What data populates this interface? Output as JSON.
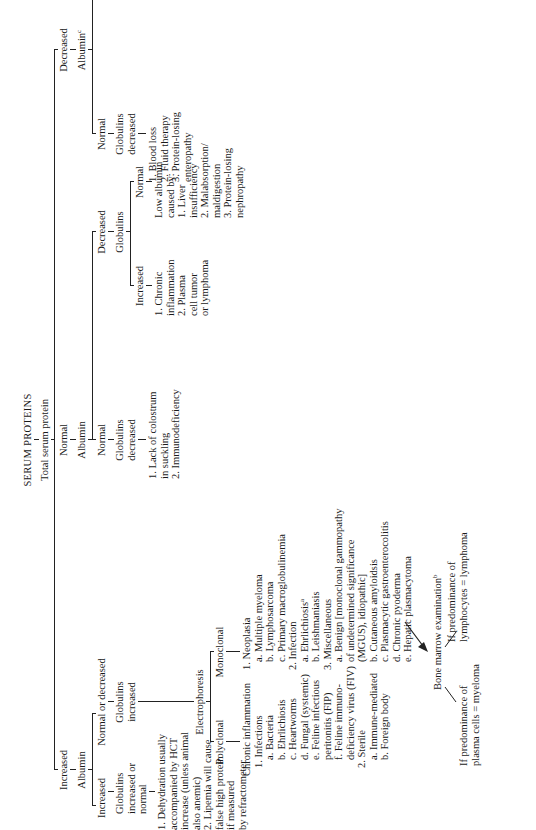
{
  "title": "SERUM PROTEINS",
  "root": "Total serum protein",
  "level1": {
    "increased": "Increased",
    "normal": "Normal",
    "decreased": "Decreased"
  },
  "branch_increased": {
    "albumin": "Albumin",
    "alb_increased": "Increased",
    "alb_normal_or_decreased": "Normal  or  decreased",
    "glob_inc_or_normal": "Globulins\nincreased or\nnormal",
    "glob_increased": "Globulins\nincreased",
    "causes": "1. Dehydration usually\naccompanied by HCT\nincrease (unless animal\nalso anemic)\n2. Lipemia will cause\nfalse high protein\nif measured\nby refractometer",
    "electrophoresis": "Electrophoresis",
    "polyclonal": "Polyclonal",
    "monoclonal": "Monoclonal",
    "polyclonal_list": [
      "Chronic inflammation",
      "1. Infections",
      "a. Bacteria",
      "b. Ehrlichiosis",
      "c. Heartworms",
      "d. Fungal (systemic)",
      "e. Feline infectious",
      "peritonitis (FIP)",
      "f. Feline immuno-",
      "deficiency virus (FIV)",
      "2. Sterile",
      "a. Immune-mediated",
      "b. Foreign body"
    ],
    "monoclonal_list": [
      "1. Neoplasia",
      "a. Multiple myeloma",
      "b. Lymphosarcoma",
      "c. Primary macroglobulinemia",
      "2. Infection",
      "a. Ehrlichiosis",
      "b. Leishmaniasis",
      "3. Miscellaneous",
      "a. Benign [monoclonal gammopathy",
      "of undetermined significance",
      "(MGUS), idiopathic]",
      "b. Cutaneous amyloidsis",
      "c. Plasmacytic gastroenterocolitis",
      "d. Chronic pyoderma",
      "e. Hepatic plasmacytoma"
    ],
    "bone_marrow": "Bone  marrow  examination",
    "bm_left": "If predominance of\nplasma cells = myeloma",
    "bm_right": "If predominance of\nlymphocytes = lymphoma"
  },
  "branch_normal": {
    "albumin": "Albumin",
    "alb_normal": "Normal",
    "alb_decreased": "Decreased",
    "glob_decreased": "Globulins\ndecreased",
    "glob_decreased_causes": "1. Lack of colostrum\nin suckling\n2. Immunodeficiency",
    "globulins": "Globulins",
    "glob_increased": "Increased",
    "glob_normal": "Normal",
    "glob_increased_causes": "1. Chronic\ninflammation\n2. Plasma\ncell tumor\nor lymphoma",
    "glob_normal_causes": "Low albumin\ncaused by:\n1. Liver\ninsufficiency\n2. Malabsorption/\nmaldigestion\n3. Protein-losing\nnephropathy"
  },
  "branch_decreased": {
    "albumin": "Albumin",
    "alb_normal": "Normal",
    "alb_decreased": "Decreased",
    "glob_decreased": "Globulins\ndecreased",
    "glob_decreased_causes": "1. Blood loss\n2. Fluid therapy\n3. Protein-losing\nenteropathy",
    "globulins": "Globulins",
    "glob_normal": "Normal\n(A:G decreased)",
    "glob_decreased2": "Decreased\n(A:G normal)",
    "glob_normal_causes": "1. Albumin loss\nas with glomerulo-\nnephropathy, enteropathy\n2. Lack of albumin\nproduction\n   a. Liver insufficiency\n   b. Chronic severe\n      malnutrition"
  },
  "footnotes": [
    "Prominent plasmacytosis may be observed in the bone marrow.",
    "Plasma cells and lymphocytes may show mild–moderate increases when there is chronic antigen",
    "stimulation elsewhere in the body; seldom exceeding 5% and 20%, respectively.",
    "Lipemia can cause a \"false low\" albumin. The patient should be fasted and the sample repeated.",
    "A:G = albumin to globulin ratio."
  ],
  "footnote_marks": [
    "a",
    "b",
    "c",
    "d"
  ]
}
